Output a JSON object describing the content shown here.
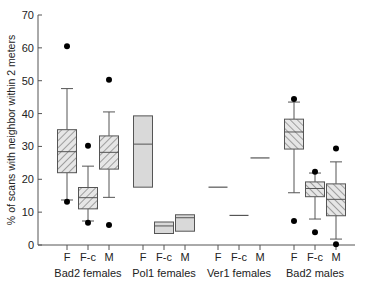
{
  "chart_data": {
    "type": "box",
    "title": "",
    "xlabel": "",
    "ylabel": "% of scans with neighbor within 2 meters",
    "ylim": [
      0,
      70
    ],
    "yticks": [
      0,
      10,
      20,
      30,
      40,
      50,
      60,
      70
    ],
    "grid": false,
    "legend": null,
    "groups": [
      {
        "name": "Bad2 females",
        "style": "hatch-forward",
        "boxes": [
          {
            "label": "F",
            "whisker_low": 13.7,
            "q1": 22.0,
            "median": 28.4,
            "q3": 35.1,
            "whisker_high": 47.6,
            "outliers": [
              60.5,
              13.2
            ]
          },
          {
            "label": "F-c",
            "whisker_low": 7.3,
            "q1": 11.0,
            "median": 14.4,
            "q3": 17.5,
            "whisker_high": 24.0,
            "outliers": [
              30.2,
              6.8
            ]
          },
          {
            "label": "M",
            "whisker_low": 14.5,
            "q1": 23.1,
            "median": 28.2,
            "q3": 33.2,
            "whisker_high": 40.5,
            "outliers": [
              50.3,
              6.1
            ]
          }
        ]
      },
      {
        "name": "Pol1 females",
        "style": "gray",
        "boxes": [
          {
            "label": "F",
            "q1": 17.6,
            "median": 30.7,
            "q3": 39.3,
            "outliers": []
          },
          {
            "label": "F-c",
            "q1": 3.5,
            "median": 5.8,
            "q3": 7.0,
            "outliers": []
          },
          {
            "label": "M",
            "q1": 4.2,
            "median": 8.3,
            "q3": 9.2,
            "outliers": []
          }
        ]
      },
      {
        "name": "Ver1 females",
        "style": "line",
        "boxes": [
          {
            "label": "F",
            "median": 17.6
          },
          {
            "label": "F-c",
            "median": 9.0
          },
          {
            "label": "M",
            "median": 26.5
          }
        ]
      },
      {
        "name": "Bad2 males",
        "style": "hatch-back",
        "boxes": [
          {
            "label": "F",
            "whisker_low": 15.9,
            "q1": 29.2,
            "median": 34.4,
            "q3": 38.3,
            "whisker_high": 43.5,
            "outliers": [
              44.4,
              7.3
            ]
          },
          {
            "label": "F-c",
            "whisker_low": 7.9,
            "q1": 14.7,
            "median": 17.2,
            "q3": 19.2,
            "whisker_high": 21.9,
            "outliers": [
              22.3,
              3.9
            ]
          },
          {
            "label": "M",
            "whisker_low": 1.8,
            "q1": 8.9,
            "median": 13.9,
            "q3": 18.6,
            "whisker_high": 25.3,
            "outliers": [
              29.4,
              0.2
            ]
          }
        ]
      }
    ]
  },
  "colors": {
    "axis": "#555555",
    "box_stroke": "#555555",
    "gray_fill": "#d9d9d9",
    "hatch": "#555555",
    "outlier": "#000000"
  }
}
